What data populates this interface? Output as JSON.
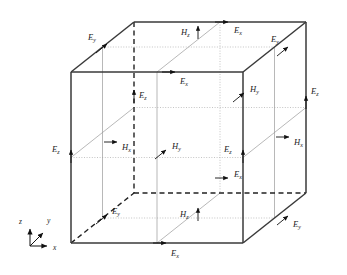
{
  "figure": {
    "type": "yee-cell-fdtd-grid",
    "title": ""
  },
  "axes": {
    "name": "coordinate-triad",
    "origin": {
      "x": 30,
      "y": 246
    },
    "items": [
      {
        "id": "z",
        "label": "z",
        "direction": "up",
        "label_x": 19,
        "label_y": 224
      },
      {
        "id": "y",
        "label": "y",
        "direction": "up-right",
        "label_x": 47,
        "label_y": 223
      },
      {
        "id": "x",
        "label": "x",
        "direction": "right",
        "label_x": 53,
        "label_y": 250
      }
    ]
  },
  "cube": {
    "front": {
      "left": 71,
      "top": 72,
      "right": 243,
      "bottom": 243
    },
    "depth": {
      "dx": 63,
      "dy": -50
    },
    "divisions": 2,
    "edge_color": "#3a3a3a",
    "grid_color": "#9a9a9a",
    "dotted_color": "#aaaaaa",
    "hidden_color": "#222222"
  },
  "field_labels": [
    {
      "id": "E-y-top-left",
      "base": "E",
      "sub": "y",
      "arrow": "up-right",
      "tip_x": 107,
      "tip_y": 44,
      "text_x": 88,
      "text_y": 40
    },
    {
      "id": "H-z-top-back",
      "base": "H",
      "sub": "z",
      "arrow": "up",
      "tip_x": 198,
      "tip_y": 26,
      "text_x": 181,
      "text_y": 35
    },
    {
      "id": "E-x-top-back",
      "base": "E",
      "sub": "x",
      "arrow": "right",
      "tip_x": 228,
      "tip_y": 22,
      "text_x": 234,
      "text_y": 33
    },
    {
      "id": "E-y-top-right",
      "base": "E",
      "sub": "y",
      "arrow": "up-right",
      "tip_x": 288,
      "tip_y": 47,
      "text_x": 271,
      "text_y": 42
    },
    {
      "id": "E-x-top-front",
      "base": "E",
      "sub": "x",
      "arrow": "right",
      "tip_x": 175,
      "tip_y": 72,
      "text_x": 180,
      "text_y": 84
    },
    {
      "id": "E-z-upper-mid",
      "base": "E",
      "sub": "z",
      "arrow": "up",
      "tip_x": 134,
      "tip_y": 90,
      "text_x": 139,
      "text_y": 98
    },
    {
      "id": "H-y-upper-right",
      "base": "H",
      "sub": "y",
      "arrow": "up-right",
      "tip_x": 244,
      "tip_y": 93,
      "text_x": 250,
      "text_y": 92
    },
    {
      "id": "E-z-right-upper",
      "base": "E",
      "sub": "z",
      "arrow": "up",
      "tip_x": 306,
      "tip_y": 96,
      "text_x": 311,
      "text_y": 94
    },
    {
      "id": "H-x-left-inner",
      "base": "H",
      "sub": "x",
      "arrow": "right",
      "tip_x": 117,
      "tip_y": 142,
      "text_x": 122,
      "text_y": 150
    },
    {
      "id": "E-z-left-edge",
      "base": "E",
      "sub": "z",
      "arrow": "up",
      "tip_x": 71,
      "tip_y": 150,
      "text_x": 52,
      "text_y": 152
    },
    {
      "id": "H-y-center",
      "base": "H",
      "sub": "y",
      "arrow": "up-right",
      "tip_x": 166,
      "tip_y": 150,
      "text_x": 172,
      "text_y": 149
    },
    {
      "id": "E-z-right-lower",
      "base": "E",
      "sub": "z",
      "arrow": "up",
      "tip_x": 243,
      "tip_y": 150,
      "text_x": 224,
      "text_y": 152
    },
    {
      "id": "H-x-right-inner",
      "base": "H",
      "sub": "x",
      "arrow": "right",
      "tip_x": 289,
      "tip_y": 137,
      "text_x": 294,
      "text_y": 145
    },
    {
      "id": "E-x-mid-dashed",
      "base": "E",
      "sub": "x",
      "arrow": "right",
      "tip_x": 228,
      "tip_y": 178,
      "text_x": 234,
      "text_y": 177
    },
    {
      "id": "E-y-bottom-left",
      "base": "E",
      "sub": "y",
      "arrow": "up-right",
      "tip_x": 107,
      "tip_y": 215,
      "text_x": 112,
      "text_y": 214
    },
    {
      "id": "H-z-bottom",
      "base": "H",
      "sub": "z",
      "arrow": "up",
      "tip_x": 198,
      "tip_y": 208,
      "text_x": 180,
      "text_y": 217
    },
    {
      "id": "E-y-bottom-right",
      "base": "E",
      "sub": "y",
      "arrow": "up-right",
      "tip_x": 288,
      "tip_y": 216,
      "text_x": 293,
      "text_y": 227
    },
    {
      "id": "E-x-bottom-front",
      "base": "E",
      "sub": "x",
      "arrow": "right",
      "tip_x": 166,
      "tip_y": 243,
      "text_x": 171,
      "text_y": 256
    }
  ]
}
